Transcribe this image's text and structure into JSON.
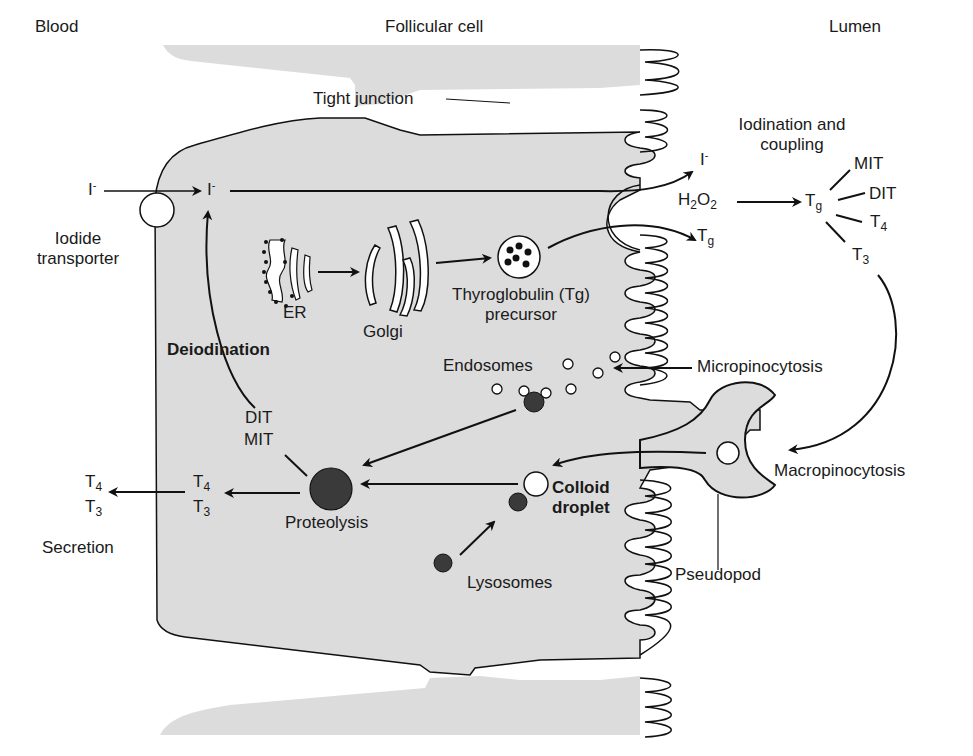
{
  "regions": {
    "blood": "Blood",
    "follicular_cell": "Follicular cell",
    "lumen": "Lumen"
  },
  "labels": {
    "tight_junction": "Tight junction",
    "iodide_transporter_line1": "Iodide",
    "iodide_transporter_line2": "transporter",
    "iodide": "I",
    "iodide_charge": "-",
    "er": "ER",
    "golgi": "Golgi",
    "tg_precursor_line1": "Thyroglobulin (Tg)",
    "tg_precursor_line2": "precursor",
    "deiodination": "Deiodination",
    "dit": "DIT",
    "mit": "MIT",
    "endosomes": "Endosomes",
    "micropinocytosis": "Micropinocytosis",
    "macropinocytosis": "Macropinocytosis",
    "pseudopod": "Pseudopod",
    "colloid_line1": "Colloid",
    "colloid_line2": "droplet",
    "lysosomes": "Lysosomes",
    "proteolysis": "Proteolysis",
    "secretion": "Secretion",
    "iodination_line1": "Iodination and",
    "iodination_line2": "coupling",
    "h2o2_h": "H",
    "h2o2_2a": "2",
    "h2o2_o": "O",
    "h2o2_2b": "2",
    "t": "T",
    "sub_g": "g",
    "sub_4": "4",
    "sub_3": "3"
  },
  "colors": {
    "cell_fill": "#dcdcdc",
    "membrane": "#111111",
    "dark_vesicle": "#3a3a3a",
    "background": "#ffffff"
  }
}
